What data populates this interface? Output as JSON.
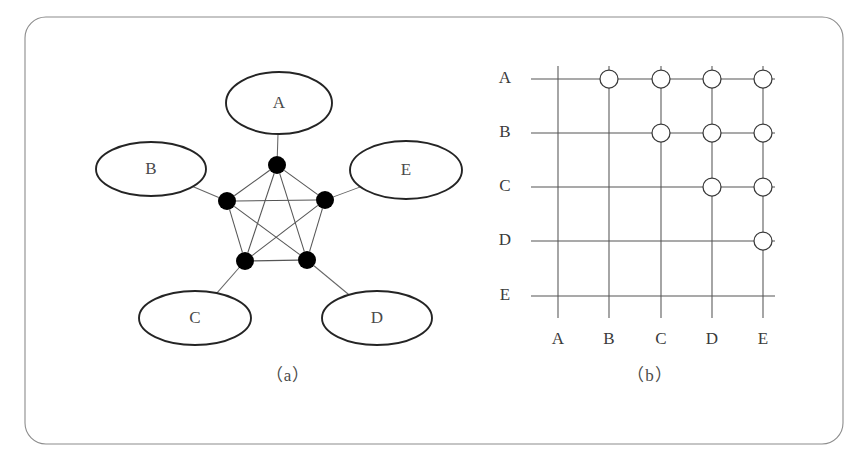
{
  "figure": {
    "width": 867,
    "height": 465,
    "background_color": "#ffffff",
    "frame": {
      "x": 25,
      "y": 17,
      "width": 818,
      "height": 427,
      "corner_radius": 21,
      "stroke_color": "#8c8c8c"
    }
  },
  "captions": {
    "panel_a": "（a）",
    "panel_b": "（b）"
  },
  "chart_data": {
    "type": "diagram",
    "title": "",
    "panels": [
      {
        "id": "a",
        "caption": "（a）",
        "kind": "node-link-graph",
        "description": "Complete graph K5 with five labelled entity ellipses attached by leader lines to five pentagon vertices",
        "vertex_count": 5,
        "edge_count": 10,
        "vertices": [
          {
            "id": "A",
            "label": "A",
            "cx": 277,
            "cy": 165,
            "r": 9
          },
          {
            "id": "E",
            "label": "E",
            "cx": 325,
            "cy": 200,
            "r": 9
          },
          {
            "id": "D",
            "label": "D",
            "cx": 307,
            "cy": 260,
            "r": 9
          },
          {
            "id": "C",
            "label": "C",
            "cx": 245,
            "cy": 261,
            "r": 9
          },
          {
            "id": "B",
            "label": "B",
            "cx": 227,
            "cy": 201,
            "r": 9
          }
        ],
        "edges": [
          [
            "A",
            "B"
          ],
          [
            "A",
            "C"
          ],
          [
            "A",
            "D"
          ],
          [
            "A",
            "E"
          ],
          [
            "B",
            "C"
          ],
          [
            "B",
            "D"
          ],
          [
            "B",
            "E"
          ],
          [
            "C",
            "D"
          ],
          [
            "C",
            "E"
          ],
          [
            "D",
            "E"
          ]
        ],
        "entity_ellipses": [
          {
            "label": "A",
            "cx": 279,
            "cy": 103,
            "rx": 53,
            "ry": 31,
            "attach_vertex": "A"
          },
          {
            "label": "B",
            "cx": 151,
            "cy": 169,
            "rx": 55,
            "ry": 27,
            "attach_vertex": "B"
          },
          {
            "label": "E",
            "cx": 406,
            "cy": 170,
            "rx": 56,
            "ry": 29,
            "attach_vertex": "E"
          },
          {
            "label": "C",
            "cx": 195,
            "cy": 318,
            "rx": 56,
            "ry": 27,
            "attach_vertex": "C"
          },
          {
            "label": "D",
            "cx": 377,
            "cy": 318,
            "rx": 55,
            "ry": 27,
            "attach_vertex": "D"
          }
        ],
        "caption_position": {
          "x": 288,
          "y": 377
        }
      },
      {
        "id": "b",
        "caption": "（b）",
        "kind": "adjacency-grid",
        "description": "Upper-triangular adjacency grid: circles mark each unordered pair of distinct nodes",
        "row_labels": [
          "A",
          "B",
          "C",
          "D",
          "E"
        ],
        "column_labels": [
          "A",
          "B",
          "C",
          "D",
          "E"
        ],
        "row_y": [
          79,
          133,
          187,
          241,
          296
        ],
        "column_x": [
          558,
          609,
          661,
          712,
          763
        ],
        "row_line": {
          "x_start": 531,
          "x_end": 775
        },
        "column_line": {
          "y_start": 66,
          "y_end": 318
        },
        "row_label_x": 505,
        "column_label_y": 340,
        "cell_radius": 9,
        "matrix": [
          [
            0,
            1,
            1,
            1,
            1
          ],
          [
            0,
            0,
            1,
            1,
            1
          ],
          [
            0,
            0,
            0,
            1,
            1
          ],
          [
            0,
            0,
            0,
            0,
            1
          ],
          [
            0,
            0,
            0,
            0,
            0
          ]
        ],
        "marked_cells": [
          {
            "row": "A",
            "col": "B"
          },
          {
            "row": "A",
            "col": "C"
          },
          {
            "row": "A",
            "col": "D"
          },
          {
            "row": "A",
            "col": "E"
          },
          {
            "row": "B",
            "col": "C"
          },
          {
            "row": "B",
            "col": "D"
          },
          {
            "row": "B",
            "col": "E"
          },
          {
            "row": "C",
            "col": "D"
          },
          {
            "row": "C",
            "col": "E"
          },
          {
            "row": "D",
            "col": "E"
          }
        ],
        "caption_position": {
          "x": 650,
          "y": 377
        }
      }
    ]
  }
}
